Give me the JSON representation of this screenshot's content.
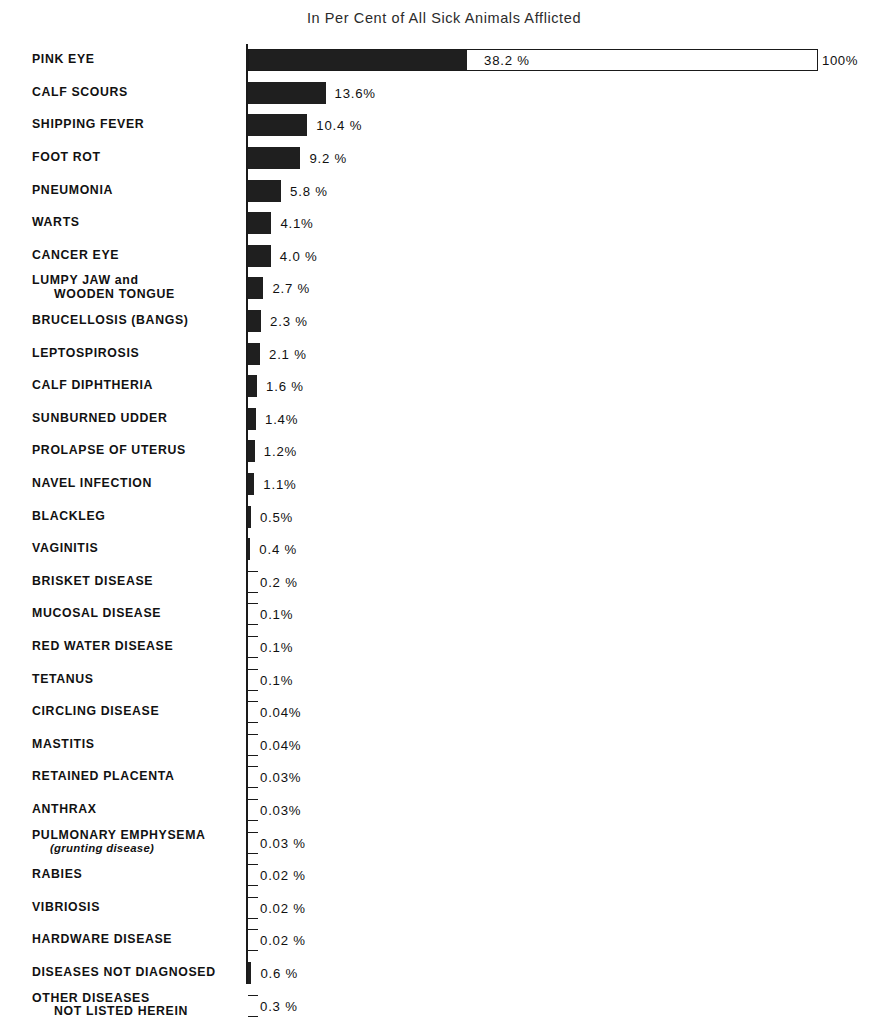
{
  "chart_data": {
    "type": "bar",
    "orientation": "horizontal",
    "title": "In Per Cent of All Sick Animals Afflicted",
    "xlabel": "",
    "ylabel": "",
    "xlim": [
      0,
      100
    ],
    "grid": false,
    "legend": null,
    "scale_reference": {
      "label": "100%",
      "value": 100
    },
    "categories": [
      "PINK EYE",
      "CALF SCOURS",
      "SHIPPING FEVER",
      "FOOT ROT",
      "PNEUMONIA",
      "WARTS",
      "CANCER EYE",
      "LUMPY JAW and WOODEN TONGUE",
      "BRUCELLOSIS (BANGS)",
      "LEPTOSPIROSIS",
      "CALF DIPHTHERIA",
      "SUNBURNED UDDER",
      "PROLAPSE OF UTERUS",
      "NAVEL INFECTION",
      "BLACKLEG",
      "VAGINITIS",
      "BRISKET DISEASE",
      "MUCOSAL DISEASE",
      "RED WATER DISEASE",
      "TETANUS",
      "CIRCLING DISEASE",
      "MASTITIS",
      "RETAINED PLACENTA",
      "ANTHRAX",
      "PULMONARY EMPHYSEMA (grunting disease)",
      "RABIES",
      "VIBRIOSIS",
      "HARDWARE DISEASE",
      "DISEASES NOT DIAGNOSED",
      "OTHER DISEASES NOT LISTED HEREIN"
    ],
    "values": [
      38.2,
      13.6,
      10.4,
      9.2,
      5.8,
      4.1,
      4.0,
      2.7,
      2.3,
      2.1,
      1.6,
      1.4,
      1.2,
      1.1,
      0.5,
      0.4,
      0.2,
      0.1,
      0.1,
      0.1,
      0.04,
      0.04,
      0.03,
      0.03,
      0.03,
      0.02,
      0.02,
      0.02,
      0.6,
      0.3
    ],
    "value_labels": [
      "38.2 %",
      "13.6%",
      "10.4 %",
      "9.2 %",
      "5.8 %",
      "4.1%",
      "4.0 %",
      "2.7 %",
      "2.3 %",
      "2.1 %",
      "1.6 %",
      "1.4%",
      "1.2%",
      "1.1%",
      "0.5%",
      "0.4 %",
      "0.2 %",
      "0.1%",
      "0.1%",
      "0.1%",
      "0.04%",
      "0.04%",
      "0.03%",
      "0.03%",
      "0.03 %",
      "0.02 %",
      "0.02 %",
      "0.02 %",
      "0.6 %",
      "0.3 %"
    ]
  },
  "rows": [
    {
      "label": "PINK EYE",
      "label_line2": "",
      "value": 38.2,
      "value_label": "38.2 %"
    },
    {
      "label": "CALF SCOURS",
      "label_line2": "",
      "value": 13.6,
      "value_label": "13.6%"
    },
    {
      "label": "SHIPPING FEVER",
      "label_line2": "",
      "value": 10.4,
      "value_label": "10.4 %"
    },
    {
      "label": "FOOT ROT",
      "label_line2": "",
      "value": 9.2,
      "value_label": "9.2 %"
    },
    {
      "label": "PNEUMONIA",
      "label_line2": "",
      "value": 5.8,
      "value_label": "5.8 %"
    },
    {
      "label": "WARTS",
      "label_line2": "",
      "value": 4.1,
      "value_label": "4.1%"
    },
    {
      "label": "CANCER EYE",
      "label_line2": "",
      "value": 4.0,
      "value_label": "4.0 %"
    },
    {
      "label": "LUMPY JAW and",
      "label_line2": "WOODEN TONGUE",
      "value": 2.7,
      "value_label": "2.7 %"
    },
    {
      "label": "BRUCELLOSIS  (BANGS)",
      "label_line2": "",
      "value": 2.3,
      "value_label": "2.3 %"
    },
    {
      "label": "LEPTOSPIROSIS",
      "label_line2": "",
      "value": 2.1,
      "value_label": "2.1 %"
    },
    {
      "label": "CALF DIPHTHERIA",
      "label_line2": "",
      "value": 1.6,
      "value_label": "1.6 %"
    },
    {
      "label": "SUNBURNED UDDER",
      "label_line2": "",
      "value": 1.4,
      "value_label": "1.4%"
    },
    {
      "label": "PROLAPSE OF UTERUS",
      "label_line2": "",
      "value": 1.2,
      "value_label": "1.2%"
    },
    {
      "label": "NAVEL INFECTION",
      "label_line2": "",
      "value": 1.1,
      "value_label": "1.1%"
    },
    {
      "label": "BLACKLEG",
      "label_line2": "",
      "value": 0.5,
      "value_label": "0.5%"
    },
    {
      "label": "VAGINITIS",
      "label_line2": "",
      "value": 0.4,
      "value_label": "0.4 %"
    },
    {
      "label": "BRISKET DISEASE",
      "label_line2": "",
      "value": 0.2,
      "value_label": "0.2 %"
    },
    {
      "label": "MUCOSAL DISEASE",
      "label_line2": "",
      "value": 0.1,
      "value_label": "0.1%"
    },
    {
      "label": "RED WATER DISEASE",
      "label_line2": "",
      "value": 0.1,
      "value_label": "0.1%"
    },
    {
      "label": "TETANUS",
      "label_line2": "",
      "value": 0.1,
      "value_label": "0.1%"
    },
    {
      "label": "CIRCLING DISEASE",
      "label_line2": "",
      "value": 0.04,
      "value_label": "0.04%"
    },
    {
      "label": "MASTITIS",
      "label_line2": "",
      "value": 0.04,
      "value_label": "0.04%"
    },
    {
      "label": "RETAINED PLACENTA",
      "label_line2": "",
      "value": 0.03,
      "value_label": "0.03%"
    },
    {
      "label": "ANTHRAX",
      "label_line2": "",
      "value": 0.03,
      "value_label": "0.03%"
    },
    {
      "label": "PULMONARY EMPHYSEMA",
      "label_line2": "(grunting disease)",
      "value": 0.03,
      "value_label": "0.03 %"
    },
    {
      "label": "RABIES",
      "label_line2": "",
      "value": 0.02,
      "value_label": "0.02 %"
    },
    {
      "label": "VIBRIOSIS",
      "label_line2": "",
      "value": 0.02,
      "value_label": "0.02 %"
    },
    {
      "label": "HARDWARE DISEASE",
      "label_line2": "",
      "value": 0.02,
      "value_label": "0.02 %"
    },
    {
      "label": "DISEASES NOT DIAGNOSED",
      "label_line2": "",
      "value": 0.6,
      "value_label": "0.6 %"
    },
    {
      "label": "OTHER DISEASES",
      "label_line2": "NOT LISTED HEREIN",
      "value": 0.3,
      "value_label": "0.3 %"
    }
  ],
  "reference": {
    "max_label": "100%",
    "filled_value_label": "38.2 %"
  },
  "colors": {
    "bar": "#1f1f1f",
    "axis": "#1a1a1a",
    "text": "#111111",
    "background": "#ffffff"
  }
}
